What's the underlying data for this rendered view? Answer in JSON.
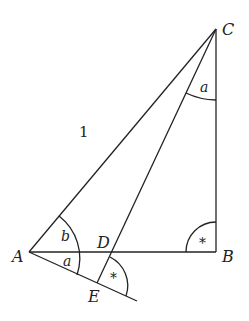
{
  "diagram": {
    "type": "geometry",
    "points": {
      "A": {
        "label": "A"
      },
      "B": {
        "label": "B"
      },
      "C": {
        "label": "C"
      },
      "D": {
        "label": "D"
      },
      "E": {
        "label": "E"
      }
    },
    "segments": [
      "AC",
      "CB",
      "AB",
      "CE",
      "AE"
    ],
    "side_labels": {
      "AC": "1"
    },
    "angle_labels": {
      "at_C": "a",
      "at_A_upper": "b",
      "at_A_lower": "a",
      "at_B": "*",
      "at_E": "*"
    }
  }
}
